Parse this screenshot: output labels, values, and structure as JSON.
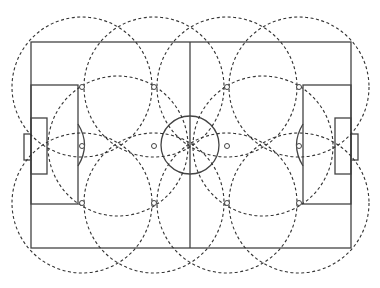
{
  "diagram": {
    "type": "soccer-pitch-coverage",
    "canvas": {
      "width": 380,
      "height": 288
    },
    "colors": {
      "pitch_lines": "#444444",
      "coverage_circles": "#333333",
      "background": "#ffffff"
    },
    "pitch": {
      "x": 31,
      "y": 42,
      "width": 320,
      "height": 206,
      "halfway_x": 190,
      "center_circle": {
        "cx": 190,
        "cy": 145,
        "r": 29
      },
      "left_penalty_area": {
        "x": 31,
        "y": 85,
        "width": 47,
        "height": 119
      },
      "left_goal_area": {
        "x": 31,
        "y": 118,
        "width": 16,
        "height": 56
      },
      "left_goal": {
        "x": 24,
        "y": 134,
        "width": 7,
        "height": 26
      },
      "left_arc": {
        "cx": 78,
        "cy": 145,
        "r": 16
      },
      "right_penalty_area": {
        "x": 303,
        "y": 85,
        "width": 48,
        "height": 119
      },
      "right_goal_area": {
        "x": 335,
        "y": 118,
        "width": 16,
        "height": 56
      },
      "right_goal": {
        "x": 351,
        "y": 134,
        "width": 7,
        "height": 26
      },
      "right_arc": {
        "cx": 303,
        "cy": 145,
        "r": 16
      }
    },
    "nodes": {
      "columns_x": [
        82,
        154,
        227,
        299
      ],
      "rows_y": [
        87,
        146,
        203
      ],
      "radius": 2.5
    },
    "coverage_circles": {
      "radius": 70,
      "centers": [
        [
          82,
          87
        ],
        [
          154,
          87
        ],
        [
          227,
          87
        ],
        [
          299,
          87
        ],
        [
          118,
          146
        ],
        [
          263,
          146
        ],
        [
          82,
          203
        ],
        [
          154,
          203
        ],
        [
          227,
          203
        ],
        [
          299,
          203
        ]
      ]
    }
  }
}
